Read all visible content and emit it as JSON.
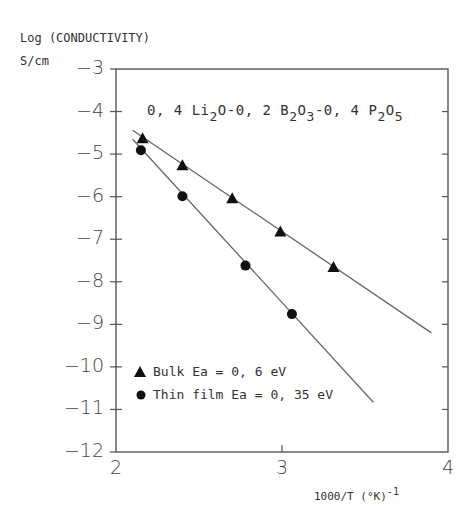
{
  "chart_data": {
    "type": "scatter",
    "composition": {
      "parts": [
        {
          "text": "0, 4 Li",
          "sub": "2"
        },
        {
          "text": "O-0, 2 B",
          "sub": "2"
        },
        {
          "text": "O",
          "sub": "3"
        },
        {
          "text": "-0, 4 P",
          "sub": "2"
        },
        {
          "text": "O",
          "sub": "5"
        }
      ]
    },
    "ylabel_line1": "Log (CONDUCTIVITY)",
    "ylabel_line2": "S/cm",
    "xlabel": "1000/T  (°K)",
    "xlabel_sup": "-1",
    "xlim": [
      2,
      4
    ],
    "ylim": [
      -12,
      -3
    ],
    "xticks": [
      "2",
      "3",
      "4"
    ],
    "yticks": [
      "-3",
      "-4",
      "-5",
      "-6",
      "-7",
      "-8",
      "-9",
      "-10",
      "-11",
      "-12"
    ],
    "grid": false,
    "legend_position": "lower-left inside",
    "series": [
      {
        "name": "Bulk Ea = 0,6 eV",
        "marker": "triangle",
        "x": [
          2.16,
          2.4,
          2.7,
          2.99,
          3.31
        ],
        "y": [
          -4.63,
          -5.26,
          -6.04,
          -6.82,
          -7.65
        ],
        "fit_line": {
          "x": [
            2.1,
            3.9
          ],
          "y": [
            -4.44,
            -9.2
          ]
        }
      },
      {
        "name": "Thin film Ea = 0,35 eV",
        "marker": "circle",
        "x": [
          2.15,
          2.4,
          2.78,
          3.06
        ],
        "y": [
          -4.91,
          -5.99,
          -7.62,
          -8.76
        ],
        "fit_line": {
          "x": [
            2.1,
            3.55
          ],
          "y": [
            -4.65,
            -10.83
          ]
        }
      }
    ]
  },
  "labels": {
    "legend_bulk": "Bulk Ea = 0, 6 eV",
    "legend_film": "Thin film Ea = 0, 35 eV"
  }
}
